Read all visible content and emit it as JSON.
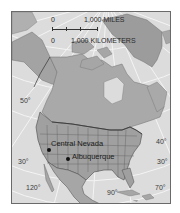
{
  "map": {
    "title": "North America reference map",
    "colors": {
      "ocean": "#dcdcdc",
      "land": "#a9a9a9",
      "land_dark": "#949494",
      "greenland": "#9c9c9c",
      "border": "#4a4a4a",
      "graticule": "#f4f4f4",
      "frame": "#6a6a6a"
    },
    "scale_bar": {
      "miles_zero": "0",
      "miles_label": "1,000 MILES",
      "km_zero": "0",
      "km_label": "1,000 KILOMETERS"
    },
    "graticule_labels": {
      "lat_50_west": "50°",
      "lat_40_east": "40°",
      "lat_30_west": "30°",
      "lat_30_east": "30°",
      "lon_120": "120°",
      "lon_90": "90°",
      "lon_70": "70°"
    },
    "locations": [
      {
        "name": "Central Nevada"
      },
      {
        "name": "Albuquerque"
      }
    ]
  }
}
